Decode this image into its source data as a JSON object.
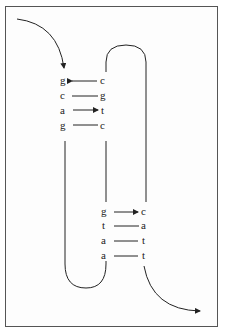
{
  "figure": {
    "type": "dna-hairpin-strand-diagram",
    "stroke_color": "#222222",
    "frame_color": "#555555",
    "top_stem": {
      "pairs": [
        {
          "left": "g",
          "right": "c",
          "arrow": "left"
        },
        {
          "left": "c",
          "right": "g",
          "arrow": "none"
        },
        {
          "left": "a",
          "right": "t",
          "arrow": "right"
        },
        {
          "left": "g",
          "right": "c",
          "arrow": "none"
        }
      ]
    },
    "bottom_stem": {
      "pairs": [
        {
          "left": "g",
          "right": "c",
          "arrow": "right"
        },
        {
          "left": "t",
          "right": "a",
          "arrow": "none"
        },
        {
          "left": "a",
          "right": "t",
          "arrow": "none"
        },
        {
          "left": "a",
          "right": "t",
          "arrow": "none"
        }
      ]
    },
    "icons": {
      "entry_arrow": "curved-arrow-down-icon",
      "exit_arrow": "curved-arrow-right-icon"
    }
  }
}
